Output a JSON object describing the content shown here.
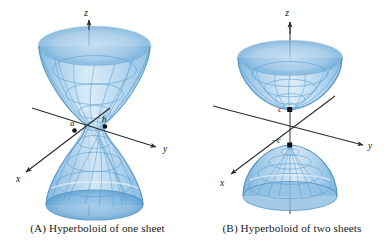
{
  "figure": {
    "background_color": "#ffffff",
    "panels": [
      {
        "id": "A",
        "caption": "(A) Hyperboloid of one sheet",
        "surface_name": "hyperboloid-of-one-sheet",
        "axes": [
          {
            "name": "z",
            "label": "z"
          },
          {
            "name": "y",
            "label": "y"
          },
          {
            "name": "x",
            "label": "x"
          }
        ],
        "point_labels": [
          {
            "name": "a",
            "label": "a"
          },
          {
            "name": "b",
            "label": "b"
          }
        ]
      },
      {
        "id": "B",
        "caption": "(B) Hyperboloid of two sheets",
        "surface_name": "hyperboloid-of-two-sheets",
        "axes": [
          {
            "name": "z",
            "label": "z"
          },
          {
            "name": "y",
            "label": "y"
          },
          {
            "name": "x",
            "label": "x"
          }
        ],
        "point_labels": [
          {
            "name": "c",
            "label": "c"
          },
          {
            "name": "minus-c",
            "label": "−c"
          }
        ]
      }
    ],
    "colors": {
      "surface_light": "#cfe4f4",
      "surface_mid": "#9ec8e8",
      "surface_dark": "#6ba9d6",
      "surface_edge": "#4f93c6",
      "grid_line": "#5f9fcf",
      "axis_line": "#2b2b2b",
      "label_text": "#111111",
      "caption_text": "#1a1a1a",
      "point_dot": "#111111"
    }
  }
}
